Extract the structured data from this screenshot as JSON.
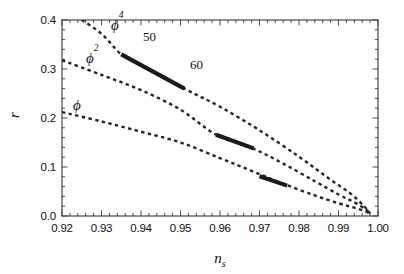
{
  "chart_data": {
    "type": "line",
    "title": "",
    "subtitle": "",
    "xlabel": "n_s",
    "ylabel": "r",
    "xlim": [
      0.92,
      1.0
    ],
    "ylim": [
      0.0,
      0.4
    ],
    "grid": false,
    "legend_position": "inline-annotations",
    "x_ticks": [
      0.92,
      0.93,
      0.94,
      0.95,
      0.96,
      0.97,
      0.98,
      0.99,
      1.0
    ],
    "x_tick_labels": [
      "0.92",
      "0.93",
      "0.94",
      "0.95",
      "0.96",
      "0.97",
      "0.98",
      "0.99",
      "1.00"
    ],
    "x_minor_per_major": 5,
    "y_ticks": [
      0.0,
      0.1,
      0.2,
      0.3,
      0.4
    ],
    "y_tick_labels": [
      "0.0",
      "0.1",
      "0.2",
      "0.3",
      "0.4"
    ],
    "y_minor_per_major": 5,
    "line_style": "dashed",
    "line_color": "#262626",
    "highlight_color": "#1a1a1a",
    "background_color": "#fdfdfd",
    "frame_color": "#333333",
    "series": [
      {
        "name": "phi",
        "label": "ϕ",
        "label_html": "ϕ",
        "style": "dashed",
        "x": [
          0.92,
          0.93,
          0.94,
          0.95,
          0.96,
          0.968,
          0.976,
          0.984,
          0.99,
          0.994,
          0.997,
          0.998
        ],
        "y": [
          0.212,
          0.193,
          0.172,
          0.15,
          0.118,
          0.092,
          0.066,
          0.042,
          0.026,
          0.017,
          0.009,
          0.005
        ],
        "highlight": {
          "name": "e-folds 50-60 band",
          "x": [
            0.97,
            0.977
          ],
          "y": [
            0.081,
            0.062
          ]
        }
      },
      {
        "name": "phi2",
        "label": "ϕ²",
        "label_base": "ϕ",
        "label_exponent": "2",
        "style": "dashed",
        "x": [
          0.92,
          0.93,
          0.94,
          0.95,
          0.959,
          0.968,
          0.976,
          0.984,
          0.99,
          0.994,
          0.997,
          0.998
        ],
        "y": [
          0.318,
          0.288,
          0.257,
          0.217,
          0.166,
          0.139,
          0.107,
          0.071,
          0.044,
          0.028,
          0.013,
          0.005
        ],
        "highlight": {
          "name": "e-folds 50-60 band",
          "x": [
            0.959,
            0.9685
          ],
          "y": [
            0.166,
            0.138
          ]
        }
      },
      {
        "name": "phi4",
        "label": "ϕ⁴",
        "label_base": "ϕ",
        "label_exponent": "4",
        "style": "dashed",
        "x": [
          0.925,
          0.93,
          0.935,
          0.94,
          0.951,
          0.96,
          0.97,
          0.98,
          0.988,
          0.993,
          0.9965,
          0.998
        ],
        "y": [
          0.4,
          0.372,
          0.33,
          0.309,
          0.26,
          0.223,
          0.175,
          0.121,
          0.074,
          0.046,
          0.02,
          0.005
        ],
        "highlight": {
          "name": "e-folds 50-60 band",
          "x": [
            0.935,
            0.951
          ],
          "y": [
            0.33,
            0.26
          ]
        }
      }
    ],
    "annotations": [
      {
        "name": "efold-50",
        "text": "50",
        "x": 0.9375,
        "y": 0.347
      },
      {
        "name": "efold-60",
        "text": "60",
        "x": 0.9505,
        "y": 0.283
      },
      {
        "name": "curve-label-phi",
        "text": "ϕ",
        "x": 0.9245,
        "y": 0.228
      },
      {
        "name": "curve-label-phi2",
        "text": "ϕ²",
        "x": 0.9272,
        "y": 0.32
      },
      {
        "name": "curve-label-phi4",
        "text": "ϕ⁴",
        "x": 0.933,
        "y": 0.388
      }
    ],
    "convergence_point": {
      "x": 0.998,
      "y": 0.005
    }
  },
  "axes": {
    "x_title_base": "n",
    "x_title_sub": "s",
    "y_title": "r"
  },
  "labels": {
    "phi": "ϕ",
    "phi2_base": "ϕ",
    "phi2_exp": "2",
    "phi4_base": "ϕ",
    "phi4_exp": "4",
    "efold_50": "50",
    "efold_60": "60"
  }
}
